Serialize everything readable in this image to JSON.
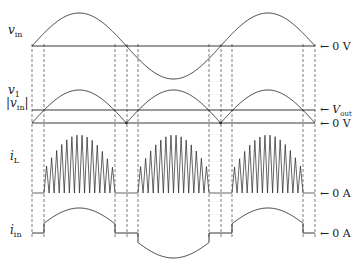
{
  "diagram": {
    "title": "",
    "colors": {
      "line": "#222222",
      "background": "#ffffff",
      "dash": "#444444"
    },
    "traces": [
      {
        "id": "v_in",
        "label_var": "v",
        "label_sub": "in",
        "reference": "0 V",
        "shape": "sine",
        "baseline_y": 46,
        "amplitude": 33
      },
      {
        "id": "v1",
        "label_var": "v",
        "label_sub": "1",
        "label2": "|v_in|",
        "label2_var": "v",
        "label2_sub": "in",
        "reference_top": "V",
        "reference_top_sub": "out",
        "reference": "0 V",
        "shape": "rectified-sine",
        "baseline_y": 123,
        "vout_y": 110,
        "amplitude": 33
      },
      {
        "id": "i_L",
        "label_var": "i",
        "label_sub": "L",
        "reference": "0 A",
        "shape": "triangular-ripple-envelope",
        "baseline_y": 193,
        "amplitude": 58,
        "spikes_per_half_cycle": 14
      },
      {
        "id": "i_in",
        "label_var": "i",
        "label_sub": "in",
        "reference": "0 A",
        "shape": "clipped-sine",
        "baseline_y": 233,
        "amplitude": 25
      }
    ],
    "x_start": 32,
    "x_end": 315,
    "half_period_px": 94.33,
    "dashed_lines_x": [
      32,
      44,
      115,
      127,
      138,
      209,
      221,
      232,
      303,
      315
    ],
    "arrow_glyph": "←",
    "labels": {
      "vin": {
        "var": "v",
        "sub": "in"
      },
      "v1": {
        "var": "v",
        "sub": "1"
      },
      "absvin": {
        "open": "|",
        "var": "v",
        "sub": "in",
        "close": "|"
      },
      "iL": {
        "var": "i",
        "sub": "L"
      },
      "iin": {
        "var": "i",
        "sub": "in"
      },
      "ref_vin": "0 V",
      "ref_vout_var": "V",
      "ref_vout_sub": "out",
      "ref_v1": "0 V",
      "ref_iL": "0 A",
      "ref_iin": "0 A"
    }
  }
}
